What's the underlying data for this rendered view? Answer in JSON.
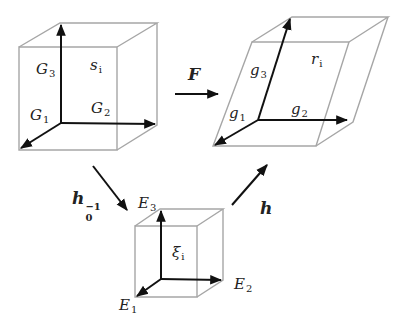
{
  "diagram": {
    "type": "configuration mapping diagram",
    "colors": {
      "frame": "#a6a6a6",
      "arrow": "#111111",
      "text": "#222222"
    },
    "reference_cube": {
      "region_label": "s_i",
      "axes": [
        {
          "name": "G",
          "sub": "1"
        },
        {
          "name": "G",
          "sub": "2"
        },
        {
          "name": "G",
          "sub": "3"
        }
      ]
    },
    "current_shape": {
      "region_label": "r_i",
      "axes": [
        {
          "name": "g",
          "sub": "1"
        },
        {
          "name": "g",
          "sub": "2"
        },
        {
          "name": "g",
          "sub": "3"
        }
      ]
    },
    "parent_cube": {
      "region_label": "ξ_i",
      "axes": [
        {
          "name": "E",
          "sub": "1"
        },
        {
          "name": "E",
          "sub": "2"
        },
        {
          "name": "E",
          "sub": "3"
        }
      ]
    },
    "maps": {
      "F": {
        "label": "F"
      },
      "h0_inv": {
        "label": "h",
        "sub": "0",
        "sup": "−1"
      },
      "h": {
        "label": "h"
      }
    },
    "labels": {
      "s": "s",
      "s_sub": "i",
      "r": "r",
      "r_sub": "i",
      "xi": "ξ",
      "xi_sub": "i"
    }
  }
}
